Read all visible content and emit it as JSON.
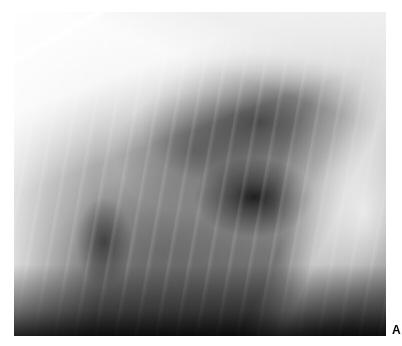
{
  "figure": {
    "type": "radiograph",
    "panel_label": "A",
    "colors": {
      "background": "#ffffff",
      "label": "#000000"
    }
  }
}
